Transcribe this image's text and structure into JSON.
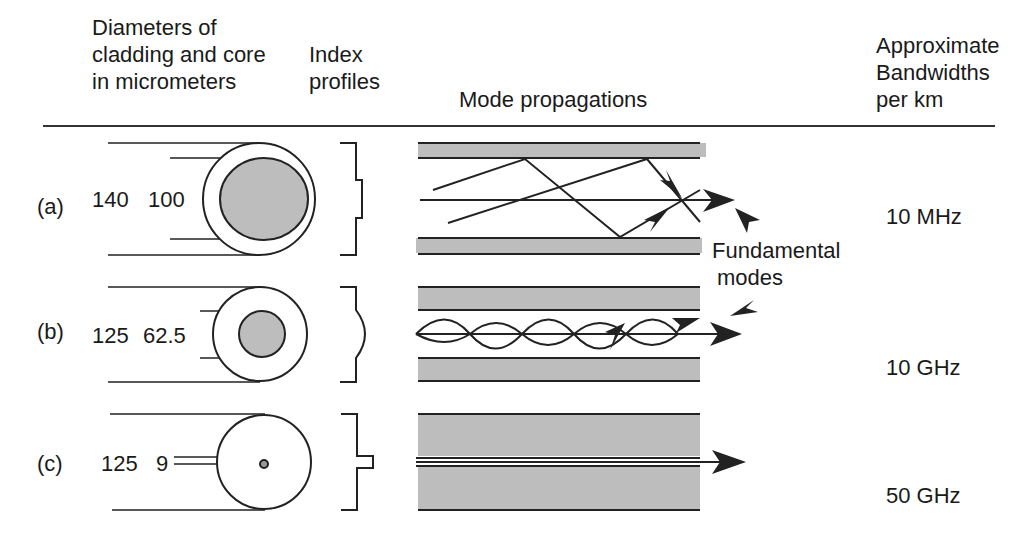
{
  "headers": {
    "diameters": [
      "Diameters of",
      "cladding and core",
      "in micrometers"
    ],
    "index": [
      "Index",
      "profiles"
    ],
    "modes": "Mode propagations",
    "bandwidth": [
      "Approximate",
      "Bandwidths",
      "per km"
    ]
  },
  "rows": [
    {
      "label": "(a)",
      "cladding": "140",
      "core": "100",
      "bandwidth": "10 MHz"
    },
    {
      "label": "(b)",
      "cladding": "125",
      "core": "62.5",
      "bandwidth": "10 GHz"
    },
    {
      "label": "(c)",
      "cladding": "125",
      "core": "9",
      "bandwidth": "50 GHz"
    }
  ],
  "annotation": [
    "Fundamental",
    "modes"
  ],
  "colors": {
    "cladding_fill": "#bdbdbd",
    "line": "#1a1a1a"
  }
}
